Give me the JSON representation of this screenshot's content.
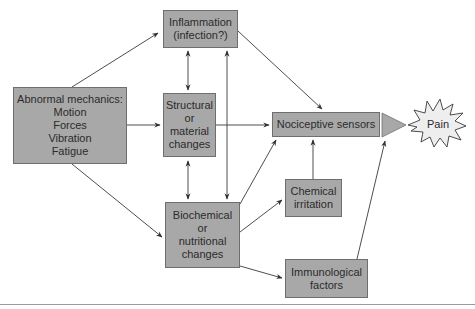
{
  "diagram": {
    "nodes": {
      "abnormal": {
        "label": "Abnormal mechanics:\nMotion\nForces\nVibration\nFatigue"
      },
      "inflammation": {
        "label": "Inflammation\n(infection?)"
      },
      "structural": {
        "label": "Structural\nor\nmaterial\nchanges"
      },
      "biochemical": {
        "label": "Biochemical\nor\nnutritional\nchanges"
      },
      "nociceptive": {
        "label": "Nociceptive sensors"
      },
      "chemical": {
        "label": "Chemical\nirritation"
      },
      "immunological": {
        "label": "Immunological\nfactors"
      },
      "pain": {
        "label": "Pain"
      }
    },
    "edges": [
      {
        "from": "abnormal",
        "to": "inflammation"
      },
      {
        "from": "abnormal",
        "to": "structural"
      },
      {
        "from": "abnormal",
        "to": "biochemical"
      },
      {
        "from": "inflammation",
        "to": "structural",
        "bidirectional": true
      },
      {
        "from": "structural",
        "to": "biochemical",
        "bidirectional": true
      },
      {
        "from": "inflammation",
        "to": "biochemical",
        "bidirectional": true
      },
      {
        "from": "inflammation",
        "to": "nociceptive"
      },
      {
        "from": "structural",
        "to": "nociceptive"
      },
      {
        "from": "biochemical",
        "to": "nociceptive"
      },
      {
        "from": "biochemical",
        "to": "chemical"
      },
      {
        "from": "biochemical",
        "to": "immunological"
      },
      {
        "from": "chemical",
        "to": "nociceptive"
      },
      {
        "from": "immunological",
        "to": "nociceptive"
      },
      {
        "from": "nociceptive",
        "to": "pain"
      }
    ],
    "colors": {
      "box_fill": "#a8a8a8",
      "box_border": "#6e6e6e",
      "line": "#3a3a3a",
      "star_fill": "#eeeeee"
    }
  }
}
